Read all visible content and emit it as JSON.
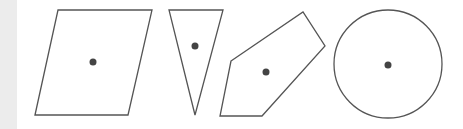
{
  "diagram": {
    "title": "",
    "stroke_color": "#555555",
    "dot_color": "#444444",
    "shapes": [
      {
        "type": "parallelogram",
        "points": "35,115 58,10 152,10 128,115",
        "dot": [
          93,
          62
        ]
      },
      {
        "type": "triangle",
        "points": "169,10 223,10 195,115",
        "dot": [
          195,
          46
        ]
      },
      {
        "type": "pentagon",
        "points": "231,61 303,12 325,46 262,116 220,116",
        "dot": [
          266,
          72
        ]
      },
      {
        "type": "circle",
        "cx": 388,
        "cy": 64,
        "r": 54,
        "dot": [
          388,
          65
        ]
      }
    ]
  }
}
